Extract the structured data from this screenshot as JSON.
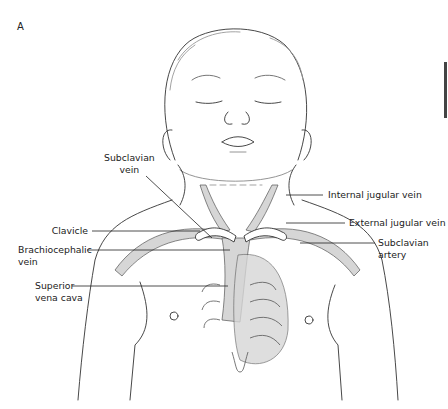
{
  "figure": {
    "panel_label": "A",
    "colors": {
      "line": "#333333",
      "vessel_fill": "#d6d6d6",
      "leader_line": "#222222"
    }
  },
  "labels": {
    "subclavian_vein": {
      "line1": "Subclavian",
      "line2": "vein"
    },
    "internal_jugular_vein": "Internal jugular vein",
    "external_jugular_vein": "External jugular vein",
    "clavicle": "Clavicle",
    "brachiocephalic_vein": {
      "line1": "Brachiocephalic",
      "line2": "vein"
    },
    "subclavian_artery": {
      "line1": "Subclavian",
      "line2": "artery"
    },
    "superior_vena_cava": {
      "line1": "Superior",
      "line2": "vena cava"
    }
  }
}
